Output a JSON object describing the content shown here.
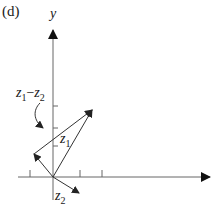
{
  "figure": {
    "panel_label": "(d)",
    "y_axis_label": "y",
    "vectors": [
      {
        "name": "z1",
        "label_main": "z",
        "label_sub": "1"
      },
      {
        "name": "z2",
        "label_main": "z",
        "label_sub": "2"
      },
      {
        "name": "z1-z2",
        "label_main1": "z",
        "label_sub1": "1",
        "minus": "−",
        "label_main2": "z",
        "label_sub2": "2"
      }
    ],
    "colors": {
      "axis": "#555555",
      "vector": "#333333",
      "text": "#1a1a1a"
    }
  }
}
